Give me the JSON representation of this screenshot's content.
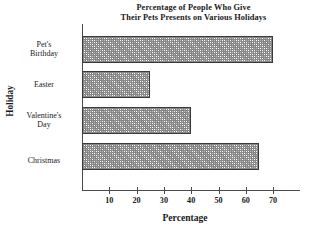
{
  "chart_data": {
    "type": "bar",
    "orientation": "horizontal",
    "title_lines": [
      "Percentage of People Who Give",
      "Their Pets Presents on Various Holidays"
    ],
    "title": "Percentage of People Who Give Their Pets Presents on Various Holidays",
    "xlabel": "Percentage",
    "ylabel": "Holiday",
    "categories": [
      "Pet's Birthday",
      "Easter",
      "Valentine's Day",
      "Christmas"
    ],
    "category_label_lines": [
      [
        "Pet's",
        "Birthday"
      ],
      [
        "Easter"
      ],
      [
        "Valentine's",
        "Day"
      ],
      [
        "Christmas"
      ]
    ],
    "values": [
      70,
      25,
      40,
      65
    ],
    "xticks": [
      10,
      20,
      30,
      40,
      50,
      60,
      70
    ],
    "xlim": [
      0,
      78
    ],
    "ylim": null,
    "grid": false,
    "legend": null,
    "bar_fill": "#8d8d8d",
    "bar_edge": "#3b3b3b",
    "axis_color": "#4a4a4a",
    "background": "#ffffff"
  }
}
